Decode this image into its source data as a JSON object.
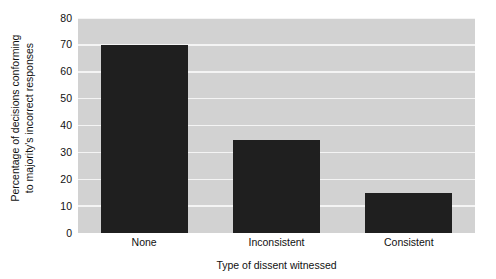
{
  "chart_data": {
    "type": "bar",
    "title": "",
    "subtitle": "",
    "categories": [
      "None",
      "Inconsistent",
      "Consistent"
    ],
    "values": [
      70,
      34.5,
      15
    ],
    "xlabel": "Type of dissent witnessed",
    "ylabel_line1": "Percentage of decisions conforming",
    "ylabel_line2": "to majority's incorrect responses",
    "ylim": [
      0,
      80
    ],
    "ytick_labels": [
      "0",
      "10",
      "20",
      "30",
      "40",
      "50",
      "60",
      "70",
      "80"
    ],
    "ytick_values": [
      0,
      10,
      20,
      30,
      40,
      50,
      60,
      70,
      80
    ],
    "grid": true,
    "grid_axis": "y",
    "legend": false,
    "legend_position": "none",
    "colors": {
      "bar": "#1f1f1f",
      "plot_background": "#d2d2d2",
      "gridline": "#f4f4f4",
      "figure_background": "#ffffff",
      "text": "#111111"
    }
  }
}
